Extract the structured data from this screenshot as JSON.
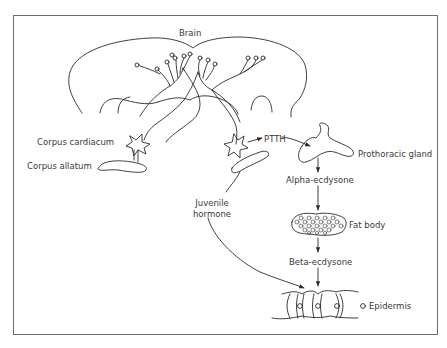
{
  "diagram": {
    "type": "biological-pathway",
    "labels": {
      "brain": "Brain",
      "corpus_cardiacum": "Corpus cardiacum",
      "corpus_allatum": "Corpus allatum",
      "ptth": "PTTH",
      "prothoracic_gland": "Prothoracic gland",
      "alpha_ecdysone": "Alpha-ecdysone",
      "fat_body": "Fat body",
      "beta_ecdysone": "Beta-ecdysone",
      "juvenile_hormone_line1": "Juvenile",
      "juvenile_hormone_line2": "hormone",
      "epidermis": "Epidermis"
    },
    "edges": [
      {
        "from": "Brain",
        "to": "Corpus cardiacum",
        "type": "neural"
      },
      {
        "from": "Corpus cardiacum",
        "to": "PTTH",
        "type": "release"
      },
      {
        "from": "PTTH",
        "to": "Prothoracic gland",
        "type": "arrow"
      },
      {
        "from": "Prothoracic gland",
        "to": "Alpha-ecdysone",
        "type": "arrow"
      },
      {
        "from": "Alpha-ecdysone",
        "to": "Fat body",
        "type": "arrow"
      },
      {
        "from": "Fat body",
        "to": "Beta-ecdysone",
        "type": "arrow"
      },
      {
        "from": "Beta-ecdysone",
        "to": "Epidermis",
        "type": "arrow"
      },
      {
        "from": "Corpus allatum",
        "to": "Juvenile hormone",
        "type": "release"
      },
      {
        "from": "Juvenile hormone",
        "to": "Epidermis",
        "type": "arrow"
      }
    ],
    "colors": {
      "line": "#2a2a2a",
      "text": "#3a3a3a",
      "frame": "#6d6d6d",
      "background": "#ffffff"
    }
  }
}
